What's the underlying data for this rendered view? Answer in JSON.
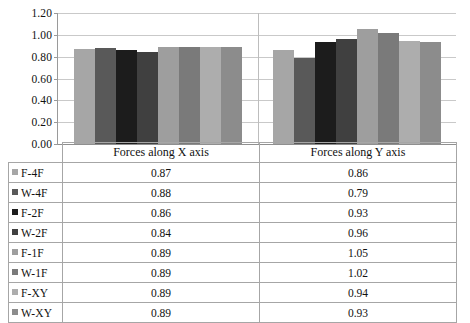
{
  "chart_data": {
    "type": "bar",
    "title": "",
    "subtitle": "",
    "xlabel": "",
    "ylabel": "",
    "categories": [
      "Forces along X axis",
      "Forces along Y axis"
    ],
    "series": [
      {
        "name": "F-4F",
        "color": "#a6a6a6",
        "values": [
          0.87,
          0.86
        ]
      },
      {
        "name": "W-4F",
        "color": "#595959",
        "values": [
          0.88,
          0.79
        ]
      },
      {
        "name": "F-2F",
        "color": "#1c1c1c",
        "values": [
          0.86,
          0.93
        ]
      },
      {
        "name": "W-2F",
        "color": "#404040",
        "values": [
          0.84,
          0.96
        ]
      },
      {
        "name": "F-1F",
        "color": "#9e9e9e",
        "values": [
          0.89,
          1.05
        ]
      },
      {
        "name": "W-1F",
        "color": "#7a7a7a",
        "values": [
          0.89,
          1.02
        ]
      },
      {
        "name": "F-XY",
        "color": "#adadad",
        "values": [
          0.89,
          0.94
        ]
      },
      {
        "name": "W-XY",
        "color": "#8c8c8c",
        "values": [
          0.89,
          0.93
        ]
      }
    ],
    "ylim": [
      0.0,
      1.2
    ],
    "yticks": [
      "0.00",
      "0.20",
      "0.40",
      "0.60",
      "0.80",
      "1.00",
      "1.20"
    ],
    "ytick_values": [
      0.0,
      0.2,
      0.4,
      0.6,
      0.8,
      1.0,
      1.2
    ],
    "grid": true,
    "legend_position": "data-table-left",
    "data_table_visible": true
  },
  "table": {
    "header_blank": "",
    "column_headers": [
      "Forces along X axis",
      "Forces along Y axis"
    ],
    "rows": [
      {
        "label": "F-4F",
        "values": [
          "0.87",
          "0.86"
        ]
      },
      {
        "label": "W-4F",
        "values": [
          "0.88",
          "0.79"
        ]
      },
      {
        "label": "F-2F",
        "values": [
          "0.86",
          "0.93"
        ]
      },
      {
        "label": "W-2F",
        "values": [
          "0.84",
          "0.96"
        ]
      },
      {
        "label": "F-1F",
        "values": [
          "0.89",
          "1.05"
        ]
      },
      {
        "label": "W-1F",
        "values": [
          "0.89",
          "1.02"
        ]
      },
      {
        "label": "F-XY",
        "values": [
          "0.89",
          "0.94"
        ]
      },
      {
        "label": "W-XY",
        "values": [
          "0.89",
          "0.93"
        ]
      }
    ]
  }
}
